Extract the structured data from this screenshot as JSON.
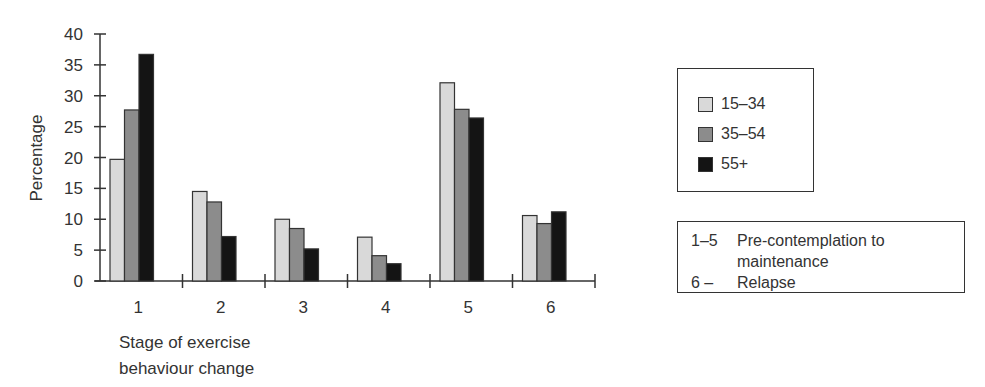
{
  "chart_data": {
    "type": "bar",
    "title": "",
    "xlabel": "Stage of exercise behaviour change",
    "ylabel": "Percentage",
    "ylim": [
      0,
      40
    ],
    "yticks": [
      0,
      5,
      10,
      15,
      20,
      25,
      30,
      35,
      40
    ],
    "categories": [
      "1",
      "2",
      "3",
      "4",
      "5",
      "6"
    ],
    "series": [
      {
        "name": "15–34",
        "color": "#d9d9d9",
        "values": [
          19.7,
          14.5,
          10.0,
          7.1,
          32.1,
          10.6
        ]
      },
      {
        "name": "35–54",
        "color": "#8c8c8c",
        "values": [
          27.7,
          12.8,
          8.5,
          4.1,
          27.8,
          9.3
        ]
      },
      {
        "name": "55+",
        "color": "#141414",
        "values": [
          36.7,
          7.2,
          5.2,
          2.8,
          26.4,
          11.2
        ]
      }
    ],
    "grid": false,
    "legend_position": "right"
  },
  "legend": {
    "items": [
      {
        "label": "15–34",
        "color": "#d9d9d9"
      },
      {
        "label": "35–54",
        "color": "#8c8c8c"
      },
      {
        "label": "55+",
        "color": "#141414"
      }
    ]
  },
  "note": {
    "rows": [
      {
        "key": "1–5",
        "text": "Pre-contemplation to"
      },
      {
        "key": "",
        "text": "maintenance"
      },
      {
        "key": "6 –",
        "text": "Relapse"
      }
    ]
  },
  "axis": {
    "ylabel": "Percentage",
    "xlabel_line1": "Stage of exercise",
    "xlabel_line2": "behaviour change"
  }
}
